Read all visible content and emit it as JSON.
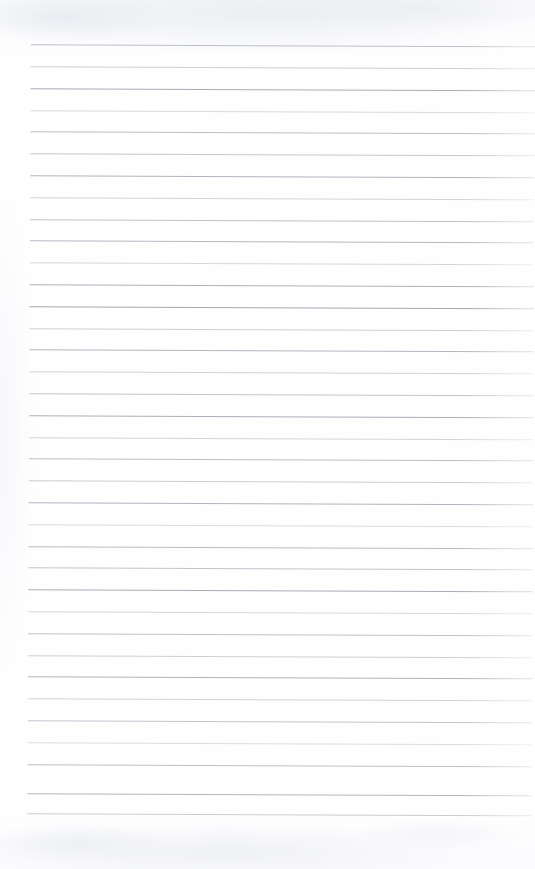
{
  "document": {
    "kind": "scanned-page",
    "title": "Blank lined notebook page",
    "page_width": 535,
    "page_height": 869,
    "background_color": "#fefeff",
    "text_content": "",
    "has_handwriting": false,
    "has_printed_text": false
  },
  "ruling": {
    "line_count": 36,
    "first_line_y": 44,
    "line_spacing": 21.8,
    "left_margin_x": 31,
    "right_edge_x": 535,
    "line_thickness": 1,
    "skew_degrees": 0.26,
    "color_dark": "#9aa0aa",
    "color_mid": "#b0b5be",
    "color_light": "#c8ccd4",
    "lines": [
      {
        "y": 44,
        "color": "#b4b9c2",
        "opacity": 0.9
      },
      {
        "y": 66,
        "color": "#c0c4cc",
        "opacity": 0.8
      },
      {
        "y": 88,
        "color": "#a3a9b3",
        "opacity": 0.95
      },
      {
        "y": 110,
        "color": "#c6cad2",
        "opacity": 0.7
      },
      {
        "y": 131,
        "color": "#b0b5be",
        "opacity": 0.88
      },
      {
        "y": 153,
        "color": "#b8bdc6",
        "opacity": 0.82
      },
      {
        "y": 175,
        "color": "#a8aeb8",
        "opacity": 0.92
      },
      {
        "y": 197,
        "color": "#c2c6ce",
        "opacity": 0.74
      },
      {
        "y": 219,
        "color": "#b2b7c0",
        "opacity": 0.86
      },
      {
        "y": 240,
        "color": "#adb2bc",
        "opacity": 0.9
      },
      {
        "y": 262,
        "color": "#c4c8d0",
        "opacity": 0.72
      },
      {
        "y": 284,
        "color": "#a6acb6",
        "opacity": 0.94
      },
      {
        "y": 306,
        "color": "#9ea4ae",
        "opacity": 0.96
      },
      {
        "y": 328,
        "color": "#bcc1c9",
        "opacity": 0.78
      },
      {
        "y": 349,
        "color": "#aab0ba",
        "opacity": 0.9
      },
      {
        "y": 371,
        "color": "#c0c5cd",
        "opacity": 0.76
      },
      {
        "y": 393,
        "color": "#b6bbc4",
        "opacity": 0.84
      },
      {
        "y": 415,
        "color": "#a4aab4",
        "opacity": 0.93
      },
      {
        "y": 437,
        "color": "#c2c7cf",
        "opacity": 0.73
      },
      {
        "y": 458,
        "color": "#b0b5bf",
        "opacity": 0.87
      },
      {
        "y": 480,
        "color": "#bac0c8",
        "opacity": 0.8
      },
      {
        "y": 502,
        "color": "#a8aeb8",
        "opacity": 0.92
      },
      {
        "y": 524,
        "color": "#c6cad2",
        "opacity": 0.7
      },
      {
        "y": 546,
        "color": "#aeb4be",
        "opacity": 0.88
      },
      {
        "y": 567,
        "color": "#b4bac3",
        "opacity": 0.84
      },
      {
        "y": 589,
        "color": "#a2a8b2",
        "opacity": 0.94
      },
      {
        "y": 611,
        "color": "#c4c9d1",
        "opacity": 0.72
      },
      {
        "y": 633,
        "color": "#b2b8c1",
        "opacity": 0.86
      },
      {
        "y": 655,
        "color": "#bec3cb",
        "opacity": 0.78
      },
      {
        "y": 676,
        "color": "#a6acb6",
        "opacity": 0.92
      },
      {
        "y": 698,
        "color": "#c0c5cd",
        "opacity": 0.75
      },
      {
        "y": 720,
        "color": "#b6bbc5",
        "opacity": 0.83
      },
      {
        "y": 742,
        "color": "#c8ccd4",
        "opacity": 0.66
      },
      {
        "y": 764,
        "color": "#b0b6bf",
        "opacity": 0.86
      },
      {
        "y": 793,
        "color": "#a9afb9",
        "opacity": 0.9
      },
      {
        "y": 813,
        "color": "#b9bec7",
        "opacity": 0.8
      }
    ]
  }
}
